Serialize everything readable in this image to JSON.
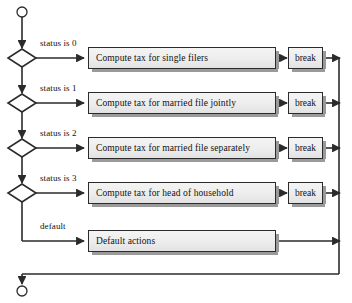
{
  "diagram": {
    "start_node": {
      "icon": "start-circle-icon"
    },
    "end_node": {
      "icon": "end-circle-icon"
    },
    "colors": {
      "stroke": "#2b2b2b",
      "box_fill_top": "#f4f4f4",
      "box_fill_bottom": "#e2e2e2",
      "box_shadow": "#9a9a9a",
      "text": "#111111",
      "background": "#ffffff"
    },
    "branches": [
      {
        "condition": "status is 0",
        "action": "Compute tax for single filers",
        "terminator": "break",
        "decision_icon": "diamond-decision-icon"
      },
      {
        "condition": "status is 1",
        "action": "Compute tax for married file jointly",
        "terminator": "break",
        "decision_icon": "diamond-decision-icon"
      },
      {
        "condition": "status is 2",
        "action": "Compute tax for married file separately",
        "terminator": "break",
        "decision_icon": "diamond-decision-icon"
      },
      {
        "condition": "status is 3",
        "action": "Compute tax for head of household",
        "terminator": "break",
        "decision_icon": "diamond-decision-icon"
      }
    ],
    "default_branch": {
      "condition": "default",
      "action": "Default actions"
    }
  }
}
